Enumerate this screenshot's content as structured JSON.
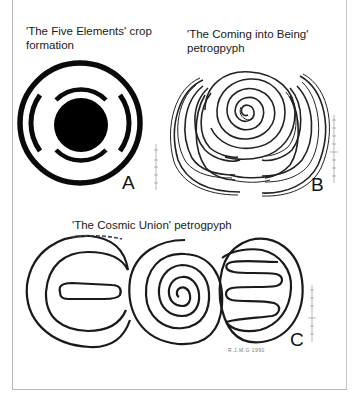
{
  "figure_a": {
    "caption_line1": "'The Five Elements' crop",
    "caption_line2": "formation",
    "label": "A"
  },
  "figure_b": {
    "caption_line1": "'The Coming into Being'",
    "caption_line2": "petrogpyph",
    "label": "B"
  },
  "figure_c": {
    "caption": "'The Cosmic Union' petrogpyph",
    "label": "C",
    "credit": "R.J.M.G 1990"
  },
  "colors": {
    "ink": "#111111",
    "frame": "#b8b8b8",
    "scale": "#888888"
  }
}
